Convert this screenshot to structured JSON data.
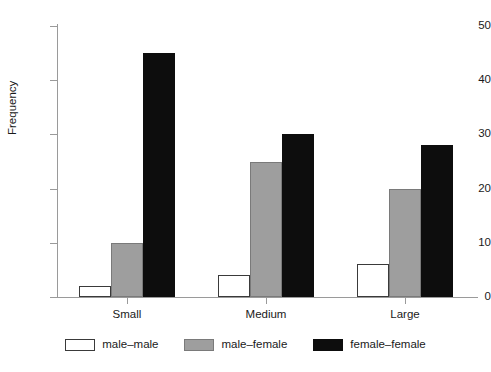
{
  "chart_data": {
    "type": "bar",
    "title": "",
    "subtitle": "",
    "xlabel": "",
    "ylabel": "Frequency",
    "categories": [
      "Small",
      "Medium",
      "Large"
    ],
    "series": [
      {
        "name": "male–male",
        "color": "#ffffff",
        "values": [
          2,
          4,
          6
        ]
      },
      {
        "name": "male–female",
        "color": "#9e9e9e",
        "values": [
          10,
          25,
          20
        ]
      },
      {
        "name": "female–female",
        "color": "#0d0d0d",
        "values": [
          45,
          30,
          28
        ]
      }
    ],
    "ylim": [
      0,
      50
    ],
    "yticks": [
      0,
      10,
      20,
      30,
      40,
      50
    ],
    "ytick_labels": [
      "0",
      "10",
      "20",
      "30",
      "40",
      "50"
    ],
    "grid": false,
    "legend_position": "bottom",
    "bar_edge_color": "#3a3a3a",
    "axis_color": "#9a9a9a"
  }
}
